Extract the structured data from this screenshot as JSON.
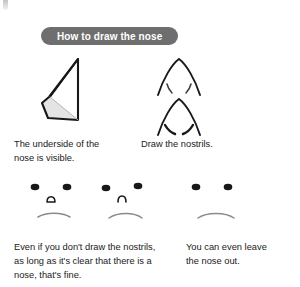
{
  "page": {
    "background_color": "#ffffff",
    "ink_color": "#1a1a1a"
  },
  "header": {
    "badge_label": "How to draw the nose",
    "badge_bg_color": "#6e6e6e",
    "badge_text_color": "#ffffff"
  },
  "figures": {
    "nose_underside": {
      "name": "nose-underside-drawing",
      "description": "three-quarter view nose wedge with shaded underside plane"
    },
    "nostrils": {
      "name": "nostrils-drawing",
      "description": "two arched nose outlines, upper with light nostril strokes, lower with bolder nostril strokes"
    },
    "face_with_nostrils": {
      "name": "face-with-nostril-nose",
      "description": "simple face: two dot eyes, small open nose shape, straight mouth"
    },
    "face_plain_nose": {
      "name": "face-with-plain-nose",
      "description": "simple face: two dot eyes, plain arch nose, straight mouth"
    },
    "face_no_nose": {
      "name": "face-without-nose",
      "description": "simple face: two dot eyes, no nose, straight mouth"
    }
  },
  "captions": {
    "underside": "The underside of the\nnose is visible.",
    "nostrils": "Draw the nostrils."
  },
  "notes": {
    "left": "Even if you don't draw the nostrils,\nas long as it's clear that there is a\nnose, that's fine.",
    "right": "You can even leave\nthe nose out."
  }
}
